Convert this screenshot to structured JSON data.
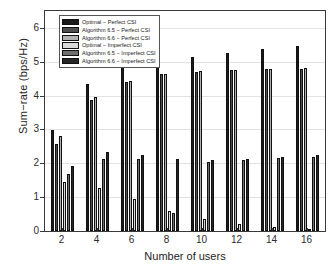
{
  "chart_data": {
    "type": "bar",
    "title": "",
    "xlabel": "Number of users",
    "ylabel": "Sum−rate (bps/Hz)",
    "categories": [
      "2",
      "4",
      "6",
      "8",
      "10",
      "12",
      "14",
      "16"
    ],
    "xtick_labels": [
      "2",
      "4",
      "6",
      "8",
      "10",
      "12",
      "14",
      "16"
    ],
    "ytick_labels": [
      "0",
      "1",
      "2",
      "3",
      "4",
      "5",
      "6"
    ],
    "yticks": [
      0,
      1,
      2,
      3,
      4,
      5,
      6
    ],
    "ylim": [
      0,
      6.5
    ],
    "grid": true,
    "legend_position": "upper-left",
    "series": [
      {
        "name": "Optimal − Perfect CSI",
        "color": "#1a1a1a",
        "values": [
          2.98,
          4.33,
          4.85,
          5.01,
          5.13,
          5.25,
          5.38,
          5.46
        ]
      },
      {
        "name": "Algorithm 6.5 − Perfect CSI",
        "color": "#4d4d4d",
        "values": [
          2.58,
          3.88,
          4.41,
          4.63,
          4.71,
          4.75,
          4.78,
          4.8
        ]
      },
      {
        "name": "Algorithm 6.6 − Perfect CSI",
        "color": "#b0b0b0",
        "values": [
          2.8,
          3.96,
          4.44,
          4.64,
          4.72,
          4.76,
          4.79,
          4.81
        ]
      },
      {
        "name": "Optimal − Imperfect CSI",
        "color": "#d9d9d9",
        "values": [
          1.44,
          1.27,
          0.94,
          0.6,
          0.36,
          0.22,
          0.12,
          0.07
        ]
      },
      {
        "name": "Algorithm 6.5 − Imperfect CSI",
        "color": "#6e6e6e",
        "values": [
          1.69,
          2.13,
          2.12,
          0.52,
          2.04,
          2.1,
          2.15,
          2.18
        ]
      },
      {
        "name": "Algorithm 6.6 − Imperfect CSI",
        "color": "#262626",
        "values": [
          1.91,
          2.32,
          2.24,
          2.12,
          2.11,
          2.14,
          2.19,
          2.24
        ]
      }
    ]
  },
  "axes": {
    "y_label": "Sum−rate (bps/Hz)",
    "x_label": "Number of users"
  }
}
